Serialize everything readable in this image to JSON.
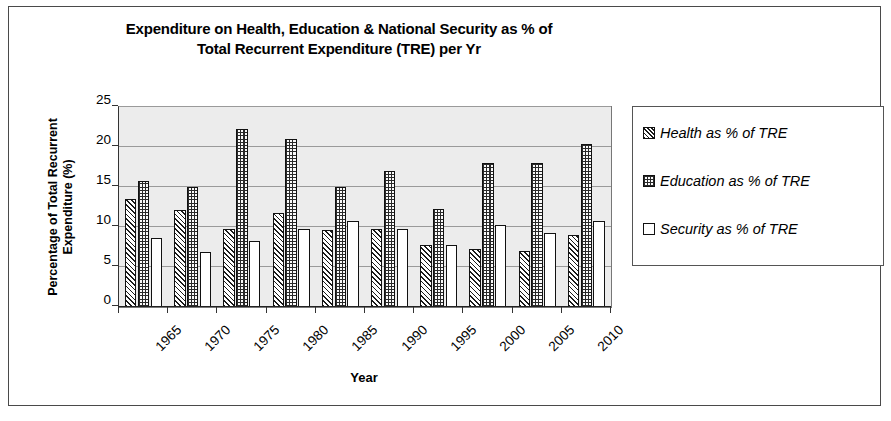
{
  "chart_data": {
    "type": "bar",
    "title": "Expenditure on Health, Education & National Security as % of Total Recurrent Expenditure (TRE) per Yr",
    "title_line1": "Expenditure on Health, Education & National Security as % of",
    "title_line2": "Total Recurrent Expenditure (TRE) per Yr",
    "xlabel": "Year",
    "ylabel": "Percentage of Total Recurrent Expenditure (%)",
    "ylabel_line1": "Percentage of Total Recurrent",
    "ylabel_line2": "Expenditure (%)",
    "categories": [
      "1965",
      "1970",
      "1975",
      "1980",
      "1985",
      "1990",
      "1995",
      "2000",
      "2005",
      "2010"
    ],
    "series": [
      {
        "name": "Health as % of TRE",
        "key": "health",
        "values": [
          13.5,
          12.1,
          9.8,
          11.7,
          9.6,
          9.7,
          7.7,
          7.2,
          7.0,
          9.0
        ]
      },
      {
        "name": "Education as % of TRE",
        "key": "education",
        "values": [
          15.7,
          15.0,
          22.2,
          21.0,
          15.0,
          17.0,
          12.2,
          18.0,
          18.0,
          20.4
        ]
      },
      {
        "name": "Security as % of TRE",
        "key": "security",
        "values": [
          8.6,
          6.9,
          8.3,
          9.7,
          10.8,
          9.7,
          7.7,
          10.2,
          9.2,
          10.8
        ]
      }
    ],
    "ylim": [
      0,
      25
    ],
    "yticks": [
      0,
      5,
      10,
      15,
      20,
      25
    ],
    "ytick_labels": [
      "0",
      "5",
      "10",
      "15",
      "20",
      "25"
    ],
    "grid": true,
    "legend_position": "right",
    "plot_background": "#ececec",
    "gridline_color": "#9a9a9a",
    "border_color": "#4a4a4a"
  },
  "legend": {
    "items": [
      {
        "label": "Health as % of TRE",
        "pattern": "diagonal-hatch"
      },
      {
        "label": "Education as % of TRE",
        "pattern": "checkered"
      },
      {
        "label": "Security as % of TRE",
        "pattern": "solid-white"
      }
    ]
  }
}
